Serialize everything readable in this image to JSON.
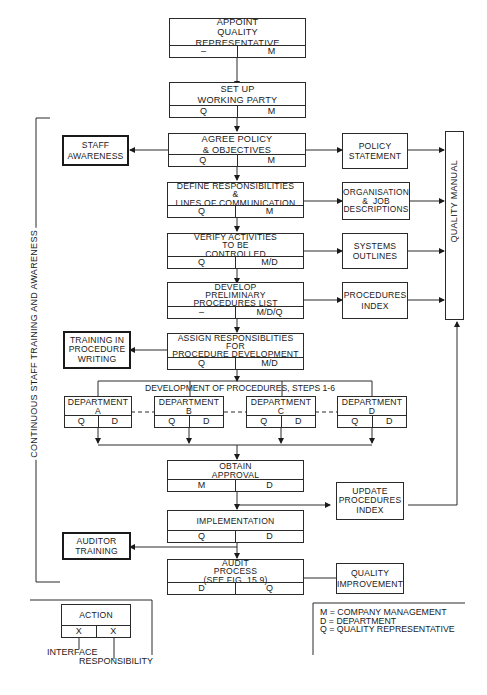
{
  "main_flow": [
    {
      "id": "appoint",
      "title": "APPOINT\nQUALITY\nREPRESENTATIVE",
      "interface": "–",
      "responsibility": "M"
    },
    {
      "id": "setup",
      "title": "SET UP\nWORKING PARTY",
      "interface": "Q",
      "responsibility": "M"
    },
    {
      "id": "policy",
      "title": "AGREE POLICY\n& OBJECTIVES",
      "interface": "Q",
      "responsibility": "M"
    },
    {
      "id": "define",
      "title": "DEFINE RESPONSIBILITIES\n&\nLINES OF COMMUNICATION",
      "interface": "Q",
      "responsibility": "M"
    },
    {
      "id": "verify",
      "title": "VERIFY ACTIVITIES\nTO BE\nCONTROLLED",
      "interface": "Q",
      "responsibility": "M/D"
    },
    {
      "id": "develop",
      "title": "DEVELOP\nPRELIMINARY\nPROCEDURES LIST",
      "interface": "–",
      "responsibility": "M/D/Q"
    },
    {
      "id": "assign",
      "title": "ASSIGN RESPONSIBLITIES\nFOR\nPROCEDURE DEVELOPMENT",
      "interface": "Q",
      "responsibility": "M/D"
    },
    {
      "id": "approval",
      "title": "OBTAIN\nAPPROVAL",
      "interface": "M",
      "responsibility": "D"
    },
    {
      "id": "implementation",
      "title": "IMPLEMENTATION",
      "interface": "Q",
      "responsibility": "D"
    },
    {
      "id": "audit",
      "title": "AUDIT\nPROCESS\n(SEE FIG. 15.9)",
      "interface": "D",
      "responsibility": "Q"
    }
  ],
  "development_label": "DEVELOPMENT OF PROCEDURES, STEPS 1-6",
  "departments": [
    {
      "title": "DEPARTMENT\nA",
      "interface": "Q",
      "responsibility": "D"
    },
    {
      "title": "DEPARTMENT\nB",
      "interface": "Q",
      "responsibility": "D"
    },
    {
      "title": "DEPARTMENT\nC",
      "interface": "Q",
      "responsibility": "D"
    },
    {
      "title": "DEPARTMENT\nD",
      "interface": "Q",
      "responsibility": "D"
    }
  ],
  "outputs": {
    "policy_statement": "POLICY\nSTATEMENT",
    "organisation": "ORGANISATION\n&  JOB\nDESCRIPTIONS",
    "systems_outlines": "SYSTEMS\nOUTLINES",
    "procedures_index": "PROCEDURES\nINDEX",
    "update_index": "UPDATE\nPROCEDURES\nINDEX",
    "quality_improvement": "QUALITY\nIMPROVEMENT",
    "quality_manual": "QUALITY MANUAL"
  },
  "training": {
    "staff_awareness": "STAFF\nAWARENESS",
    "procedure_writing": "TRAINING IN\nPROCEDURE\nWRITING",
    "auditor": "AUDITOR\nTRAINING",
    "continuous_label": "CONTINUOUS STAFF TRAINING AND AWARENESS"
  },
  "legend": {
    "action": "ACTION",
    "x1": "X",
    "x2": "X",
    "interface": "INTERFACE",
    "responsibility": "RESPONSIBILITY",
    "key": "M = COMPANY MANAGEMENT\nD = DEPARTMENT\nQ = QUALITY REPRESENTATIVE"
  }
}
